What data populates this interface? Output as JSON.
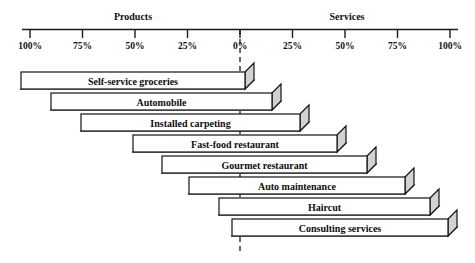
{
  "chart_data": {
    "type": "bar",
    "title": "",
    "subtitle": "",
    "orientation": "horizontal",
    "style": "3d-stepped-continuum",
    "xlabel": "",
    "ylabel": "",
    "grid": false,
    "legend_position": "none",
    "axis": {
      "left_group_label": "Products",
      "right_group_label": "Services",
      "tick_labels": [
        "100%",
        "75%",
        "50%",
        "25%",
        "0%",
        "25%",
        "50%",
        "75%",
        "100%"
      ],
      "tick_values": [
        -100,
        -75,
        -50,
        -25,
        0,
        25,
        50,
        75,
        100
      ],
      "xlim": [
        -100,
        100
      ],
      "zero_marker_label": "0%"
    },
    "categories": [
      "Self-service groceries",
      "Automobile",
      "Installed carpeting",
      "Fast-food restaurant",
      "Gourmet restaurant",
      "Auto maintenance",
      "Haircut",
      "Consulting services"
    ],
    "series": [
      {
        "name": "Products",
        "values": [
          100,
          93,
          86,
          75,
          64,
          50,
          10,
          2
        ]
      },
      {
        "name": "Services",
        "values": [
          2,
          8,
          16,
          30,
          44,
          58,
          90,
          100
        ]
      }
    ],
    "annotations": [
      "Bars step downward from product-dominant to service-dominant",
      "Dashed vertical reference line at 0%"
    ]
  },
  "colors": {
    "bar_face": "#ffffff",
    "bar_shadow": "#d2d2d2",
    "outline": "#131313",
    "axis": "#1a1a1a",
    "text": "#111111",
    "background": "#ffffff"
  },
  "bar_geometry": [
    {
      "label": "Self-service groceries",
      "x1": 21,
      "x2": 245,
      "y": 72
    },
    {
      "label": "Automobile",
      "x1": 51,
      "x2": 272,
      "y": 93
    },
    {
      "label": "Installed carpeting",
      "x1": 81,
      "x2": 300,
      "y": 114
    },
    {
      "label": "Fast-food restaurant",
      "x1": 133,
      "x2": 337,
      "y": 135
    },
    {
      "label": "Gourmet restaurant",
      "x1": 162,
      "x2": 367,
      "y": 156
    },
    {
      "label": "Auto maintenance",
      "x1": 189,
      "x2": 405,
      "y": 177
    },
    {
      "label": "Haircut",
      "x1": 219,
      "x2": 430,
      "y": 198
    },
    {
      "label": "Consulting services",
      "x1": 232,
      "x2": 448,
      "y": 219
    }
  ]
}
